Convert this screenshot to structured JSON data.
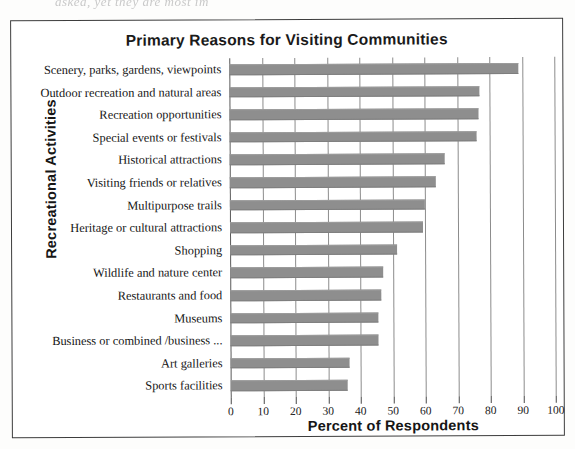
{
  "page": {
    "top_fragment": "asked, yet they are most im"
  },
  "figure": {
    "title": "Primary Reasons for Visiting Communities"
  },
  "axes": {
    "y_title": "Recreational Activities",
    "x_title": "Percent of Respondents"
  },
  "chart_data": {
    "type": "bar",
    "orientation": "horizontal",
    "title": "Primary Reasons for Visiting Communities",
    "xlabel": "Percent of Respondents",
    "ylabel": "Recreational Activities",
    "xlim": [
      0,
      100
    ],
    "xticks": [
      0,
      10,
      20,
      30,
      40,
      50,
      60,
      70,
      80,
      90,
      100
    ],
    "xtick_labels": [
      "0",
      "10",
      "20",
      "30",
      "40",
      "50",
      "60",
      "70",
      "80",
      "90",
      "100"
    ],
    "grid": "vertical",
    "legend": "none",
    "bar_color": "#8e8e8e",
    "categories": [
      "Scenery, parks, gardens, viewpoints",
      "Outdoor recreation and natural areas",
      "Recreation opportunities",
      "Special events or festivals",
      "Historical attractions",
      "Visiting friends or relatives",
      "Multipurpose trails",
      "Heritage or cultural attractions",
      "Shopping",
      "Wildlife and nature center",
      "Restaurants and food",
      "Museums",
      "Business or combined /business ...",
      "Art galleries",
      "Sports facilities"
    ],
    "values": [
      89,
      77,
      76.5,
      76,
      66,
      63.5,
      60,
      59.5,
      51.5,
      47,
      46.5,
      45.5,
      45.5,
      36.5,
      36
    ]
  }
}
